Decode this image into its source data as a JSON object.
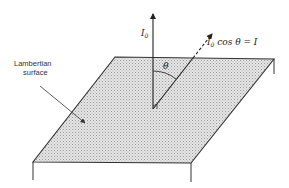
{
  "figure": {
    "type": "lambertian-surface-diagram",
    "labels": {
      "normal_intensity": "I",
      "normal_intensity_sub": "0",
      "oblique_intensity_prefix": "I",
      "oblique_intensity_sub": "0",
      "oblique_intensity_rest": " cos θ = I",
      "angle": "θ",
      "surface_line1": "Lambertian",
      "surface_line2": "surface"
    },
    "colors": {
      "line": "#333333",
      "surface_fill": "#d9d9d9",
      "text": "#222222"
    }
  }
}
